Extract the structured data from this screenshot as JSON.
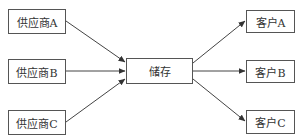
{
  "diagram": {
    "type": "flow",
    "suppliers": [
      {
        "id": "sA",
        "label": "供应商A"
      },
      {
        "id": "sB",
        "label": "供应商B"
      },
      {
        "id": "sC",
        "label": "供应商C"
      }
    ],
    "storage": {
      "id": "st",
      "label": "储存"
    },
    "customers": [
      {
        "id": "cA",
        "label": "客户A"
      },
      {
        "id": "cB",
        "label": "客户B"
      },
      {
        "id": "cC",
        "label": "客户C"
      }
    ],
    "edges": [
      {
        "from": "供应商A",
        "to": "储存"
      },
      {
        "from": "供应商B",
        "to": "储存"
      },
      {
        "from": "供应商C",
        "to": "储存"
      },
      {
        "from": "储存",
        "to": "客户A"
      },
      {
        "from": "储存",
        "to": "客户B"
      },
      {
        "from": "储存",
        "to": "客户C"
      }
    ],
    "colors": {
      "line": "#444444",
      "border": "#555555",
      "text": "#333333"
    }
  }
}
